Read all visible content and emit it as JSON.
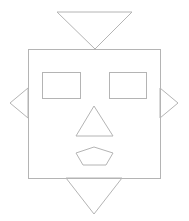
{
  "canvas": {
    "width": 189,
    "height": 221,
    "background": "#ffffff"
  },
  "stroke_color": "#b4b4b4",
  "shapes": {
    "head": {
      "type": "rect",
      "x": 28,
      "y": 49,
      "width": 132,
      "height": 129
    },
    "antenna_triangle": {
      "type": "triangle",
      "points": "57,12 132,12 95,49"
    },
    "left_ear_triangle": {
      "type": "triangle",
      "points": "28,88 10,103 28,118"
    },
    "right_ear_triangle": {
      "type": "triangle",
      "points": "160,88 178,103 160,118"
    },
    "left_eye": {
      "type": "rect",
      "x": 42,
      "y": 72,
      "width": 38,
      "height": 26
    },
    "right_eye": {
      "type": "rect",
      "x": 109,
      "y": 72,
      "width": 37,
      "height": 26
    },
    "nose_triangle": {
      "type": "triangle",
      "points": "94,106 113,136 76,136"
    },
    "mouth_pentagon": {
      "type": "pentagon",
      "points": "94,147 113,153 106,165 83,165 76,153"
    },
    "chin_triangle": {
      "type": "triangle",
      "points": "66,178 122,178 94,214"
    }
  }
}
